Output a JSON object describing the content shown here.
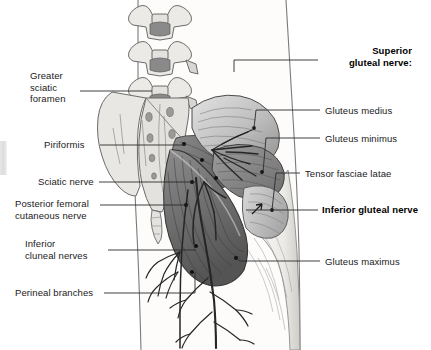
{
  "figure": {
    "background_color": "#ffffff",
    "text_color": "#1a1a1a",
    "width": 431,
    "height": 350
  },
  "labels_left": [
    {
      "id": "greater-sciatic-foramen",
      "text": "Greater\nsciatic\nforamen",
      "x": 30,
      "y": 70,
      "bold": false
    },
    {
      "id": "piriformis",
      "text": "Piriformis",
      "x": 44,
      "y": 139,
      "bold": false
    },
    {
      "id": "sciatic-nerve",
      "text": "Sciatic nerve",
      "x": 38,
      "y": 177,
      "bold": false
    },
    {
      "id": "posterior-femoral-cutaneous-nerve",
      "text": "Posterior femoral\ncutaneous nerve",
      "x": 17,
      "y": 198,
      "bold": false
    },
    {
      "id": "inferior-cluneal-nerves",
      "text": "Inferior\ncluneal nerves",
      "x": 25,
      "y": 240,
      "bold": false
    },
    {
      "id": "perineal-branches",
      "text": "Perineal branches",
      "x": 17,
      "y": 288,
      "bold": false
    }
  ],
  "labels_right": [
    {
      "id": "superior-gluteal-nerve",
      "text": "Superior\ngluteal nerve:",
      "x": 320,
      "y": 46,
      "bold": true
    },
    {
      "id": "gluteus-medius",
      "text": "Gluteus medius",
      "x": 325,
      "y": 105,
      "bold": false
    },
    {
      "id": "gluteus-minimus",
      "text": "Gluteus minimus",
      "x": 325,
      "y": 133,
      "bold": false
    },
    {
      "id": "tensor-fasciae-latae",
      "text": "Tensor fasciae latae",
      "x": 305,
      "y": 169,
      "bold": false
    },
    {
      "id": "inferior-gluteal-nerve",
      "text": "Inferior gluteal nerve",
      "x": 322,
      "y": 205,
      "bold": true
    },
    {
      "id": "gluteus-maximus",
      "text": "Gluteus maximus",
      "x": 325,
      "y": 256,
      "bold": false
    }
  ],
  "anatomy": {
    "structures": [
      "lumbar vertebrae",
      "sacrum",
      "ilium",
      "coccyx",
      "piriformis muscle",
      "gluteus medius muscle",
      "gluteus minimus muscle",
      "gluteus maximus muscle",
      "tensor fasciae latae muscle",
      "sciatic nerve",
      "superior gluteal nerve",
      "inferior gluteal nerve",
      "posterior femoral cutaneous nerve",
      "inferior cluneal nerves",
      "perineal branches"
    ],
    "palette": {
      "bone_fill": "#e8e6e2",
      "bone_outline": "#6b6b6b",
      "canal_fill": "#8a8a8a",
      "muscle_light": "#cfcfcf",
      "muscle_mid": "#a0a0a0",
      "muscle_dark": "#6e6e6e",
      "muscle_darkest": "#4a4a4a",
      "nerve": "#2b2b2b",
      "leader_line": "#2b2b2b",
      "skin": "#f0eeea"
    }
  }
}
